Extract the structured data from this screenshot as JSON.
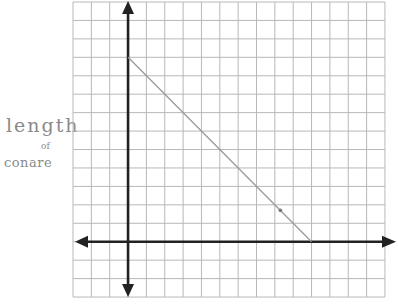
{
  "chart_data": {
    "type": "line",
    "title": "",
    "xlabel": "",
    "ylabel": "length of candle",
    "ylabel_lines": [
      "length",
      "of",
      "candle"
    ],
    "ylabel_as_written": [
      "length",
      "of",
      "conare"
    ],
    "grid": true,
    "grid_cols": 17,
    "grid_rows": 16,
    "origin_grid": {
      "col": 3,
      "row": 13
    },
    "xlim": [
      -3,
      14
    ],
    "ylim": [
      -3,
      13
    ],
    "tick_labels": [],
    "series": [
      {
        "name": "candle length",
        "x": [
          0,
          10
        ],
        "y": [
          10,
          0
        ],
        "color": "#9a9a9a"
      }
    ],
    "annotations": [
      {
        "type": "dot",
        "x": 8.3,
        "y": 1.7
      }
    ],
    "axes_arrows": [
      "up",
      "down",
      "left",
      "right"
    ]
  },
  "colors": {
    "grid": "#b8b8b8",
    "axis": "#222222",
    "line": "#9a9a9a",
    "label": "#8a8a8a"
  },
  "layout": {
    "left": 73,
    "top": 2,
    "cell_w": 18.35,
    "cell_h": 18.44
  }
}
